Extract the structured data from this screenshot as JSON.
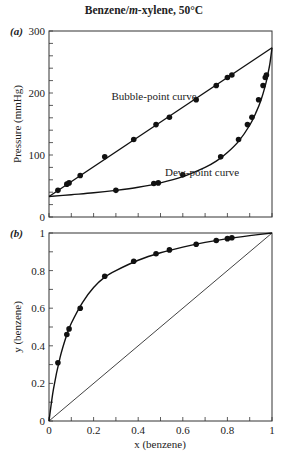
{
  "title": {
    "prefix": "Benzene/",
    "italic": "m",
    "suffix": "-xylene, 50°C"
  },
  "chart_data": [
    {
      "type": "line",
      "panel_label": "(a)",
      "title": "Benzene/m-xylene, 50°C",
      "xlabel": "",
      "ylabel": "Pressure (mmHg)",
      "xlim": [
        0,
        1
      ],
      "ylim": [
        0,
        300
      ],
      "yticks": [
        0,
        100,
        200,
        300
      ],
      "ytick_labels": [
        "0",
        "100",
        "200",
        "300"
      ],
      "y_minor_step": 20,
      "x_minor_step": 0.1,
      "grid": false,
      "annotations": [
        {
          "text": "Bubble-point curve",
          "x": 0.28,
          "y": 188
        },
        {
          "text": "Dew-point curve",
          "x": 0.52,
          "y": 66
        }
      ],
      "series": [
        {
          "name": "Bubble-point curve",
          "kind": "line",
          "x": [
            0,
            1
          ],
          "y": [
            33,
            273
          ]
        },
        {
          "name": "Bubble-point data",
          "kind": "scatter",
          "x": [
            0.04,
            0.08,
            0.09,
            0.14,
            0.25,
            0.38,
            0.48,
            0.54,
            0.66,
            0.75,
            0.8,
            0.82
          ],
          "y": [
            43,
            53,
            55,
            67,
            97,
            125,
            149,
            161,
            189,
            212,
            225,
            229
          ]
        },
        {
          "name": "Dew-point curve",
          "kind": "line",
          "x": [
            0,
            0.1,
            0.2,
            0.3,
            0.4,
            0.5,
            0.6,
            0.7,
            0.75,
            0.8,
            0.85,
            0.9,
            0.93,
            0.95,
            0.97,
            0.98,
            0.99,
            1.0
          ],
          "y": [
            33,
            36,
            39,
            43,
            48,
            55,
            65,
            80,
            90,
            104,
            122,
            148,
            170,
            188,
            212,
            228,
            246,
            273
          ]
        },
        {
          "name": "Dew-point data",
          "kind": "scatter",
          "x": [
            0.3,
            0.47,
            0.49,
            0.6,
            0.77,
            0.85,
            0.89,
            0.91,
            0.94,
            0.96,
            0.97,
            0.975
          ],
          "y": [
            43,
            54,
            55,
            68,
            97,
            125,
            149,
            161,
            189,
            212,
            225,
            229
          ]
        }
      ]
    },
    {
      "type": "line",
      "panel_label": "(b)",
      "xlabel": "x (benzene)",
      "ylabel": "y (benzene)",
      "xlim": [
        0,
        1
      ],
      "ylim": [
        0,
        1
      ],
      "xticks": [
        0,
        0.2,
        0.4,
        0.6,
        0.8,
        1
      ],
      "xtick_labels": [
        "0",
        "0.2",
        "0.4",
        "0.6",
        "0.8",
        "1"
      ],
      "yticks": [
        0,
        0.2,
        0.4,
        0.6,
        0.8,
        1
      ],
      "ytick_labels": [
        "0",
        "0.2",
        "0.4",
        "0.6",
        "0.8",
        "1"
      ],
      "x_minor_step": 0.1,
      "y_minor_step": 0.1,
      "grid": false,
      "series": [
        {
          "name": "Equilibrium curve",
          "kind": "line",
          "x": [
            0,
            0.02,
            0.05,
            0.08,
            0.1,
            0.15,
            0.2,
            0.25,
            0.3,
            0.4,
            0.5,
            0.6,
            0.7,
            0.8,
            0.9,
            1.0
          ],
          "y": [
            0,
            0.17,
            0.34,
            0.46,
            0.52,
            0.63,
            0.71,
            0.765,
            0.8,
            0.855,
            0.895,
            0.925,
            0.95,
            0.97,
            0.986,
            1.0
          ]
        },
        {
          "name": "Experimental data",
          "kind": "scatter",
          "x": [
            0.04,
            0.08,
            0.09,
            0.14,
            0.25,
            0.38,
            0.48,
            0.54,
            0.66,
            0.75,
            0.8,
            0.82
          ],
          "y": [
            0.31,
            0.46,
            0.49,
            0.6,
            0.77,
            0.85,
            0.89,
            0.91,
            0.94,
            0.96,
            0.97,
            0.975
          ]
        },
        {
          "name": "Diagonal y = x",
          "kind": "line",
          "x": [
            0,
            1
          ],
          "y": [
            0,
            1
          ]
        }
      ]
    }
  ]
}
